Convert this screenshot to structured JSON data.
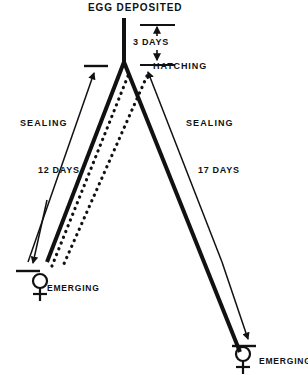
{
  "diagram": {
    "colors": {
      "ink": "#111111",
      "background": "#ffffff"
    },
    "labels": {
      "egg_deposited": "EGG DEPOSITED",
      "days_incubation": "3 DAYS",
      "hatching": "HATCHING",
      "sealing_left": "SEALING",
      "sealing_right": "SEALING",
      "days_left": "12 DAYS",
      "days_right": "17 DAYS",
      "emerging_left": "EMERGING",
      "emerging_right": "EMERGING"
    },
    "symbols": {
      "female_left": "female-symbol",
      "female_right": "female-symbol"
    },
    "branches": [
      {
        "name": "left-branch",
        "duration_label": "12 DAYS",
        "stage_label": "SEALING",
        "outcome_label": "EMERGING",
        "outcome_symbol": "female-symbol"
      },
      {
        "name": "right-branch",
        "duration_label": "17 DAYS",
        "stage_label": "SEALING",
        "outcome_label": "EMERGING",
        "outcome_symbol": "female-symbol"
      }
    ]
  }
}
